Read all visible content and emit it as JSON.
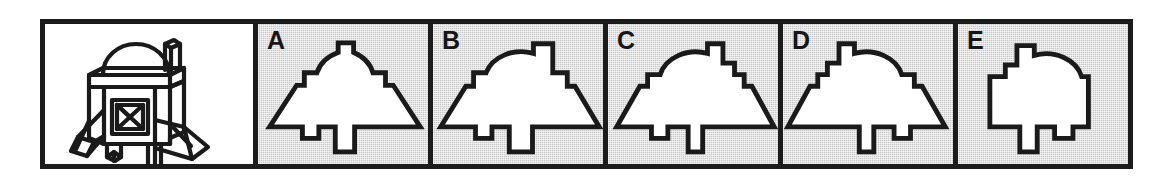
{
  "item": {
    "type": "mental-rotation-multiple-choice",
    "stimulus": {
      "label": "",
      "description": "satellite-like 3d object with dome top, antenna, cubic body with x-braced square panel, two angled solar wings and two legs",
      "background_color": "#ffffff"
    },
    "frame": {
      "border_color": "#1c1c1c",
      "background_color": "#ffffff"
    },
    "options": [
      {
        "label": "A",
        "background_color": "#c9c9c9",
        "shape_fill": "#ffffff",
        "shape_stroke": "#1a1a1a",
        "description": "symmetric bell silhouette, centered dome, small antenna nub on top center, flared skirt, short left foot and long center leg"
      },
      {
        "label": "B",
        "background_color": "#c9c9c9",
        "shape_fill": "#ffffff",
        "shape_stroke": "#1a1a1a",
        "description": "asymmetric bell silhouette, dome offset left, tall rectangular antenna on right shoulder, flared skirt, short left foot and wide center leg"
      },
      {
        "label": "C",
        "background_color": "#c9c9c9",
        "shape_fill": "#ffffff",
        "shape_stroke": "#1a1a1a",
        "description": "asymmetric bell silhouette, dome offset left, stepped antenna on right shoulder, flared skirt, short left foot and narrow center leg"
      },
      {
        "label": "D",
        "background_color": "#c9c9c9",
        "shape_fill": "#ffffff",
        "shape_stroke": "#1a1a1a",
        "description": "mirrored asymmetric bell silhouette, dome offset right, antenna on left shoulder, flared skirt, short left foot and narrow center leg"
      },
      {
        "label": "E",
        "background_color": "#c9c9c9",
        "shape_fill": "#ffffff",
        "shape_stroke": "#1a1a1a",
        "description": "narrow silhouette without flared skirt, dome offset right, antenna on left shoulder, short left foot and narrow center leg"
      }
    ]
  }
}
